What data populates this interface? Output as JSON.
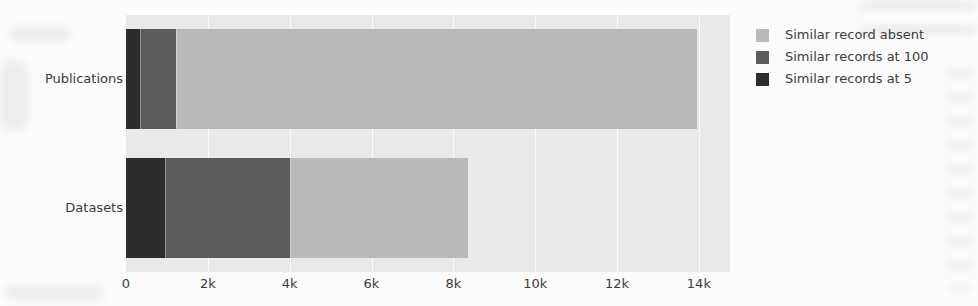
{
  "figure": {
    "kind": "scanned grayscale stacked bar chart",
    "background_color": "#fcfcfc",
    "plot_background_color": "#e9e9e9",
    "gridline_color": "#ffffff",
    "text_color": "#3b3b3b"
  },
  "chart_data": {
    "type": "bar",
    "orientation": "horizontal",
    "stacked": true,
    "title": "",
    "xlabel": "",
    "ylabel": "",
    "grid": true,
    "categories": [
      "Publications",
      "Datasets"
    ],
    "series": [
      {
        "name": "Similar records at 5",
        "values": [
          330,
          950
        ],
        "color": "#2c2c2c"
      },
      {
        "name": "Similar records at 100",
        "values": [
          880,
          3050
        ],
        "color": "#5c5c5c"
      },
      {
        "name": "Similar record absent",
        "values": [
          12750,
          4350
        ],
        "color": "#b9b9b9"
      }
    ],
    "stack_order": "left-to-right",
    "totals": {
      "Publications": 13960,
      "Datasets": 8350
    },
    "xlim": [
      0,
      14760
    ],
    "xticks": {
      "values": [
        0,
        2000,
        4000,
        6000,
        8000,
        10000,
        12000,
        14000
      ],
      "labels": [
        "0",
        "2k",
        "4k",
        "6k",
        "8k",
        "10k",
        "12k",
        "14k"
      ]
    },
    "legend": {
      "position": "top-right-outside",
      "entries": [
        "Similar record absent",
        "Similar records at 100",
        "Similar records at 5"
      ]
    }
  }
}
